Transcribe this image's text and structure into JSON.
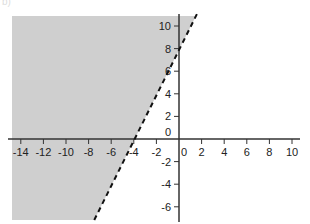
{
  "part_label": "b)",
  "chart_data": {
    "type": "line",
    "title": "",
    "xlabel": "",
    "ylabel": "",
    "xlim": [
      -15,
      11
    ],
    "ylim": [
      -7,
      11
    ],
    "grid": false,
    "x_ticks": [
      -14,
      -12,
      -10,
      -8,
      -6,
      -4,
      -2,
      0,
      2,
      4,
      6,
      8,
      10
    ],
    "y_ticks": [
      -6,
      -4,
      -2,
      0,
      2,
      4,
      6,
      8,
      10
    ],
    "series": [
      {
        "name": "boundary y = 2x + 8",
        "style": "dashed",
        "x": [
          -7.5,
          1.5
        ],
        "y": [
          -7,
          11
        ]
      }
    ],
    "shaded_region": {
      "description": "inequality y > 2x + 8 (region left/above dashed line)",
      "color": "#cfcfcf"
    }
  },
  "colors": {
    "shade": "#cfcfcf",
    "axis": "#333333",
    "line": "#111111"
  }
}
